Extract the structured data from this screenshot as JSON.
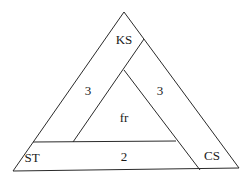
{
  "diagram": {
    "type": "nested-triangle",
    "line_color": "#2a2a2a",
    "labels": {
      "top": "KS",
      "bottom_left": "ST",
      "bottom_right": "CS",
      "center": "fr",
      "left_band": "3",
      "right_band": "3",
      "bottom_band": "2"
    }
  }
}
